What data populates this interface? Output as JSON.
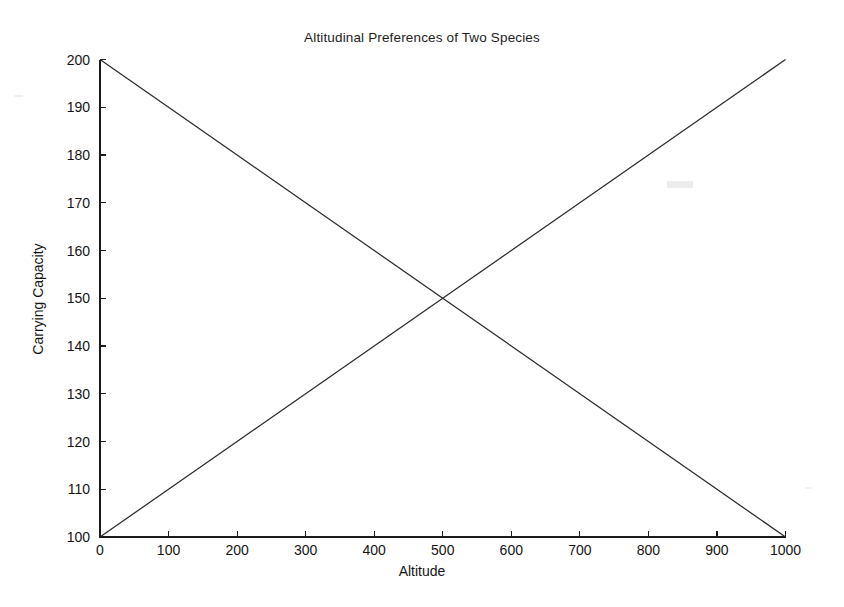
{
  "chart_data": {
    "type": "line",
    "title": "Altitudinal Preferences of Two Species",
    "xlabel": "Altitude",
    "ylabel": "Carrying Capacity",
    "xlim": [
      0,
      1000
    ],
    "ylim": [
      100,
      200
    ],
    "xticks": [
      0,
      100,
      200,
      300,
      400,
      500,
      600,
      700,
      800,
      900,
      1000
    ],
    "yticks": [
      100,
      110,
      120,
      130,
      140,
      150,
      160,
      170,
      180,
      190,
      200
    ],
    "grid": false,
    "legend": "none",
    "line_color": "#2b2b2b",
    "background_color": "#ffffff",
    "axis_color": "#1a1a1a",
    "intersection": {
      "x": 500,
      "y": 150
    },
    "series": [
      {
        "name": "Species 1 (decreasing)",
        "x": [
          0,
          100,
          200,
          300,
          400,
          500,
          600,
          700,
          800,
          900,
          1000
        ],
        "values": [
          200,
          190,
          180,
          170,
          160,
          150,
          140,
          130,
          120,
          110,
          100
        ]
      },
      {
        "name": "Species 2 (increasing)",
        "x": [
          0,
          100,
          200,
          300,
          400,
          500,
          600,
          700,
          800,
          900,
          1000
        ],
        "values": [
          100,
          110,
          120,
          130,
          140,
          150,
          160,
          170,
          180,
          190,
          200
        ]
      }
    ]
  }
}
